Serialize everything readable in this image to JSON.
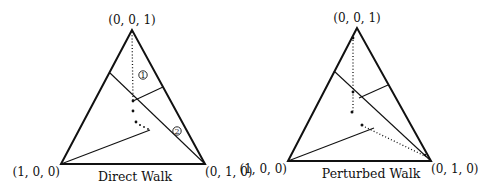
{
  "figures": [
    {
      "caption": "Direct Walk",
      "vertices": {
        "top": "(0, 0, 1)",
        "left": "(1, 0, 0)",
        "right": "(0, 1, 0)"
      },
      "regions": [
        {
          "label": "1"
        },
        {
          "label": "2"
        }
      ]
    },
    {
      "caption": "Perturbed Walk",
      "vertices": {
        "top": "(0, 0, 1)",
        "left": "(1, 0, 0)",
        "right": "(0, 1, 0)"
      }
    }
  ]
}
